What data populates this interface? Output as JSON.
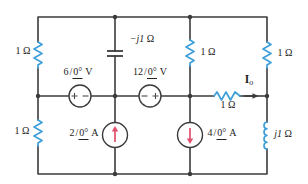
{
  "figure_type": "ac-circuit-schematic",
  "colors": {
    "background": "#ffffff",
    "wire": "#3b3b3d",
    "component": "#3f9fd8",
    "arrow": "#e0506e",
    "text": "#222222"
  },
  "notation": {
    "angle_slash": "/"
  },
  "components": {
    "resistor_top_left": {
      "label": "1 Ω"
    },
    "resistor_bottom_left": {
      "label": "1 Ω"
    },
    "capacitor": {
      "label_value": "−j1",
      "label_unit": "Ω"
    },
    "resistor_middle_branch": {
      "label": "1 Ω"
    },
    "resistor_top_right": {
      "label": "1 Ω"
    },
    "inductor": {
      "label_value": "j1",
      "label_unit": "Ω"
    },
    "resistor_series": {
      "label": "1 Ω"
    },
    "voltage_source_1": {
      "magnitude": "6",
      "angle": "0°",
      "unit": "V",
      "polarity": "plus-left-minus-right"
    },
    "voltage_source_2": {
      "magnitude": "12",
      "angle": "0°",
      "unit": "V",
      "polarity": "minus-left-plus-right"
    },
    "current_source_1": {
      "magnitude": "2",
      "angle": "0°",
      "unit": "A",
      "direction": "up"
    },
    "current_source_2": {
      "magnitude": "4",
      "angle": "0°",
      "unit": "A",
      "direction": "down"
    },
    "output_current": {
      "symbol": "I",
      "subscript": "o",
      "direction": "right"
    }
  }
}
